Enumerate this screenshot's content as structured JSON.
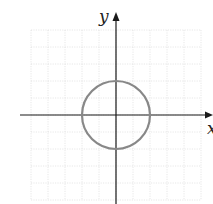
{
  "diagram": {
    "type": "coordinate-plane",
    "axes": {
      "x_label": "x",
      "y_label": "y"
    },
    "grid": {
      "x_min": -5,
      "x_max": 5,
      "y_min": -5,
      "y_max": 5,
      "unit_px": 17
    },
    "shape": {
      "type": "circle",
      "center": [
        0,
        0
      ],
      "radius": 2,
      "color": "#888888"
    },
    "colors": {
      "axis": "#1a1a1a",
      "grid": "#d6d6d6"
    }
  }
}
